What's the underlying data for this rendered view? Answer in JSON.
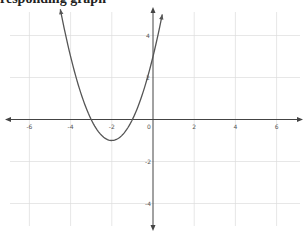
{
  "caption": "responding graph",
  "colors": {
    "grid": "#dcdcdc",
    "axis": "#444444",
    "curve": "#555555",
    "tick_label": "#555555"
  },
  "chart_data": {
    "type": "line",
    "title": "",
    "xlabel": "",
    "ylabel": "",
    "function": "y = x^2 + 4x + 3",
    "vertex": [
      -2,
      -1
    ],
    "roots": [
      -3,
      -1
    ],
    "y_intercept": 3,
    "x": [
      -4.5,
      -4,
      -3.5,
      -3,
      -2.5,
      -2,
      -1.5,
      -1,
      -0.5,
      0,
      0.45
    ],
    "series": [
      {
        "name": "parabola",
        "values": [
          5.25,
          3,
          1.25,
          0,
          -0.75,
          -1,
          -0.75,
          0,
          1.25,
          3,
          5.0
        ]
      }
    ],
    "x_ticks": [
      -6,
      -4,
      -2,
      0,
      2,
      4,
      6
    ],
    "y_ticks": [
      4,
      2,
      0,
      -2,
      -4
    ],
    "x_tick_labels": [
      "-6",
      "-4",
      "-2",
      "0",
      "2",
      "4",
      "6"
    ],
    "y_tick_labels": [
      "4",
      "2",
      "-2",
      "-4"
    ],
    "xlim": [
      -7,
      7
    ],
    "ylim": [
      -5.2,
      5.2
    ],
    "grid": true,
    "grid_step": 2,
    "legend": null
  }
}
